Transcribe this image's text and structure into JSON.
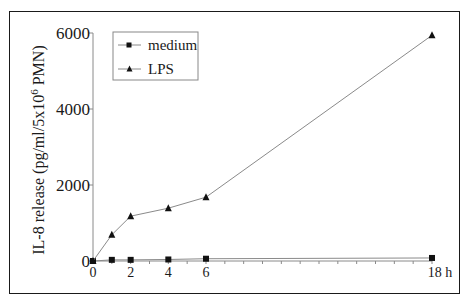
{
  "chart_data": {
    "type": "line",
    "title": "",
    "xlabel": "h",
    "ylabel": "IL-8 release (pg/ml/5x10^6 PMN)",
    "ylabel_parts": {
      "pre": "IL-8 release (pg/ml/5x10",
      "sup": "6",
      "post": " PMN)"
    },
    "x_ticks_labeled": [
      "0",
      "2",
      "4",
      "6",
      "18 h"
    ],
    "y_ticks": [
      "0",
      "2000",
      "4000",
      "6000"
    ],
    "xlim": [
      0,
      18
    ],
    "ylim": [
      0,
      6000
    ],
    "grid": false,
    "legend_position": "upper left",
    "x": [
      0,
      1,
      2,
      4,
      6,
      18
    ],
    "series": [
      {
        "name": "medium",
        "marker": "square",
        "values": [
          0,
          30,
          30,
          40,
          60,
          80
        ]
      },
      {
        "name": "LPS",
        "marker": "triangle",
        "values": [
          0,
          690,
          1180,
          1390,
          1680,
          5940
        ]
      }
    ]
  },
  "legend": {
    "items": [
      {
        "label": "medium"
      },
      {
        "label": "LPS"
      }
    ]
  },
  "colors": {
    "line": "#8a8a8a",
    "marker": "#111111",
    "frame": "#1a1a1a"
  }
}
